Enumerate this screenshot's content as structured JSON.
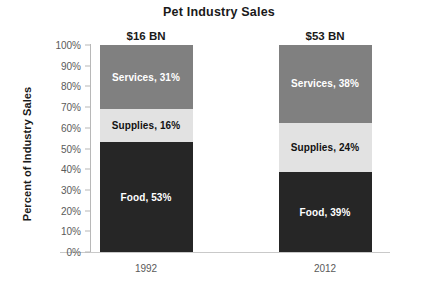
{
  "chart_data": {
    "type": "bar",
    "subtype": "stacked-100-percent",
    "title": "Pet Industry Sales",
    "xlabel": "",
    "ylabel": "Percent of Industry Sales",
    "ylim": [
      0,
      100
    ],
    "ytick_labels": [
      "100%",
      "90%",
      "80%",
      "70%",
      "60%",
      "50%",
      "40%",
      "30%",
      "20%",
      "10%",
      "0%"
    ],
    "ytick_values": [
      100,
      90,
      80,
      70,
      60,
      50,
      40,
      30,
      20,
      10,
      0
    ],
    "grid": false,
    "legend": "none",
    "legend_position": "none",
    "categories": [
      "1992",
      "2012"
    ],
    "series": [
      {
        "name": "Food",
        "values": [
          53,
          39
        ]
      },
      {
        "name": "Supplies",
        "values": [
          16,
          24
        ]
      },
      {
        "name": "Services",
        "values": [
          31,
          38
        ]
      }
    ],
    "bar_totals": [
      "$16 BN",
      "$53 BN"
    ],
    "bars": [
      {
        "category": "1992",
        "total_label": "$16 BN",
        "segments": [
          {
            "name": "Services",
            "value": 31,
            "label": "Services, 31%",
            "color": "#808080",
            "text_color": "#ffffff"
          },
          {
            "name": "Supplies",
            "value": 16,
            "label": "Supplies, 16%",
            "color": "#e2e2e2",
            "text_color": "#111111"
          },
          {
            "name": "Food",
            "value": 53,
            "label": "Food, 53%",
            "color": "#262626",
            "text_color": "#ffffff"
          }
        ]
      },
      {
        "category": "2012",
        "total_label": "$53 BN",
        "segments": [
          {
            "name": "Services",
            "value": 38,
            "label": "Services, 38%",
            "color": "#808080",
            "text_color": "#ffffff"
          },
          {
            "name": "Supplies",
            "value": 24,
            "label": "Supplies, 24%",
            "color": "#e2e2e2",
            "text_color": "#111111"
          },
          {
            "name": "Food",
            "value": 39,
            "label": "Food, 39%",
            "color": "#262626",
            "text_color": "#ffffff"
          }
        ]
      }
    ],
    "colors": {
      "food": "#262626",
      "supplies": "#e2e2e2",
      "services": "#808080",
      "axis": "#b8b8b8",
      "tick_text": "#5a5a5a",
      "title_text": "#1a1a1a"
    }
  }
}
